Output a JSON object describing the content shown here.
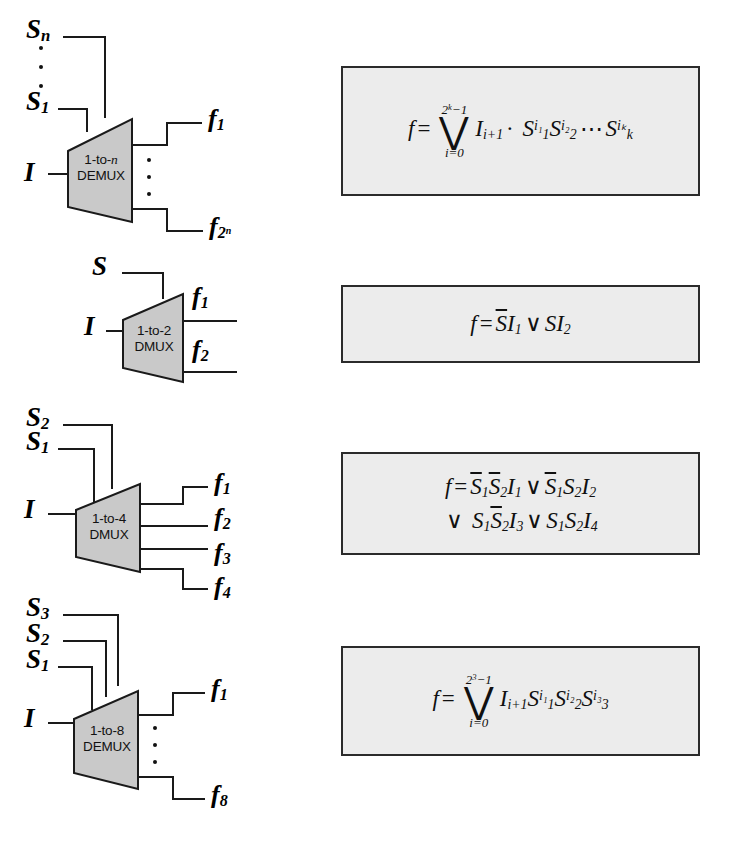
{
  "figure": {
    "type": "logic-diagram",
    "rows": 4
  },
  "blocks": [
    {
      "id": "demux-n",
      "label_line1": "1-to-n",
      "label_line2": "DEMUX",
      "label_italic_part": "n",
      "data_input": "I",
      "selects": [
        "S",
        "S"
      ],
      "select_labels": [
        {
          "base": "S",
          "sub": "n"
        },
        {
          "base": "S",
          "sub": "1"
        }
      ],
      "select_ellipsis": true,
      "outputs": [
        {
          "base": "f",
          "sub": "1"
        },
        {
          "base": "f",
          "sub": "2",
          "sup": "n"
        }
      ],
      "output_ellipsis": true,
      "equation": {
        "lhs": "f",
        "eq": "=",
        "sum_upper_base": "2",
        "sum_upper_sup": "k",
        "sum_upper_tail": "−1",
        "sum_lower": "i=0",
        "term": "I",
        "term_sub": "i+1",
        "dot": "·",
        "factors": [
          {
            "base": "S",
            "sub": "1",
            "sup": "i₁"
          },
          {
            "base": "S",
            "sub": "2",
            "sup": "i₂"
          },
          {
            "base": "S",
            "sub": "k",
            "sup": "iₖ"
          }
        ],
        "cdots": "⋯"
      }
    },
    {
      "id": "demux-2",
      "label_line1": "1-to-2",
      "label_line2": "DMUX",
      "data_input": "I",
      "select_labels": [
        {
          "base": "S",
          "sub": ""
        }
      ],
      "outputs": [
        {
          "base": "f",
          "sub": "1"
        },
        {
          "base": "f",
          "sub": "2"
        }
      ],
      "equation": {
        "lhs": "f",
        "eq": "=",
        "plain": "S̅I₁ ∨ SI₂"
      }
    },
    {
      "id": "demux-4",
      "label_line1": "1-to-4",
      "label_line2": "DMUX",
      "data_input": "I",
      "select_labels": [
        {
          "base": "S",
          "sub": "2"
        },
        {
          "base": "S",
          "sub": "1"
        }
      ],
      "outputs": [
        {
          "base": "f",
          "sub": "1"
        },
        {
          "base": "f",
          "sub": "2"
        },
        {
          "base": "f",
          "sub": "3"
        },
        {
          "base": "f",
          "sub": "4"
        }
      ],
      "equation": {
        "lhs": "f",
        "eq": "=",
        "line1": "S̅1 S̅2 I1 ∨ S̅1 S2 I2",
        "line2": "∨ S1 S̅2 I3 ∨ S1 S2 I4"
      }
    },
    {
      "id": "demux-8",
      "label_line1": "1-to-8",
      "label_line2": "DEMUX",
      "data_input": "I",
      "select_labels": [
        {
          "base": "S",
          "sub": "3"
        },
        {
          "base": "S",
          "sub": "2"
        },
        {
          "base": "S",
          "sub": "1"
        }
      ],
      "outputs": [
        {
          "base": "f",
          "sub": "1"
        },
        {
          "base": "f",
          "sub": "8"
        }
      ],
      "output_ellipsis": true,
      "equation": {
        "lhs": "f",
        "eq": "=",
        "sum_upper_base": "2",
        "sum_upper_sup": "3",
        "sum_upper_tail": "−1",
        "sum_lower": "i=0",
        "term": "I",
        "term_sub": "i+1",
        "factors": [
          {
            "base": "S",
            "sub": "1",
            "sup": "i₁"
          },
          {
            "base": "S",
            "sub": "2",
            "sup": "i₂"
          },
          {
            "base": "S",
            "sub": "3",
            "sup": "i₃"
          }
        ]
      }
    }
  ],
  "symbols": {
    "or": "∨",
    "dot": "·",
    "cdots": "⋯",
    "bigvee": "⋁",
    "minus": "−",
    "equals": "="
  },
  "colors": {
    "page_background": "#ffffff",
    "wire": "#1a1a1a",
    "demux_fill": "#c9c9c9",
    "demux_stroke": "#1a1a1a",
    "equation_box_fill": "#ececec",
    "equation_box_border": "#2b2b2b",
    "text": "#000000"
  }
}
